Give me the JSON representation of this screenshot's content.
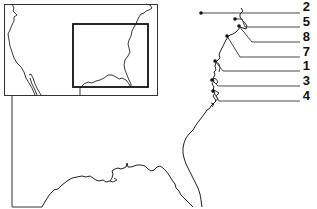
{
  "map": {
    "type": "location-map",
    "description_visible": "Inset map of contiguous United States with Southeast highlighted; enlarged eastern US coastline with numbered site markers",
    "colors": {
      "line": "#111111",
      "background": "#ffffff"
    },
    "inset": {
      "highlight_box": "southeastern-us"
    },
    "sites": [
      {
        "label": "2",
        "marker": [
          201,
          13
        ],
        "label_y": 13
      },
      {
        "label": "5",
        "marker": [
          235,
          19
        ],
        "label_y": 27
      },
      {
        "label": "8",
        "marker": [
          239,
          26
        ],
        "label_y": 42
      },
      {
        "label": "7",
        "marker": [
          227,
          36
        ],
        "label_y": 57
      },
      {
        "label": "1",
        "marker": [
          215,
          61
        ],
        "label_y": 71
      },
      {
        "label": "3",
        "marker": [
          212,
          80
        ],
        "label_y": 86
      },
      {
        "label": "4",
        "marker": [
          213,
          91
        ],
        "label_y": 101
      }
    ]
  }
}
